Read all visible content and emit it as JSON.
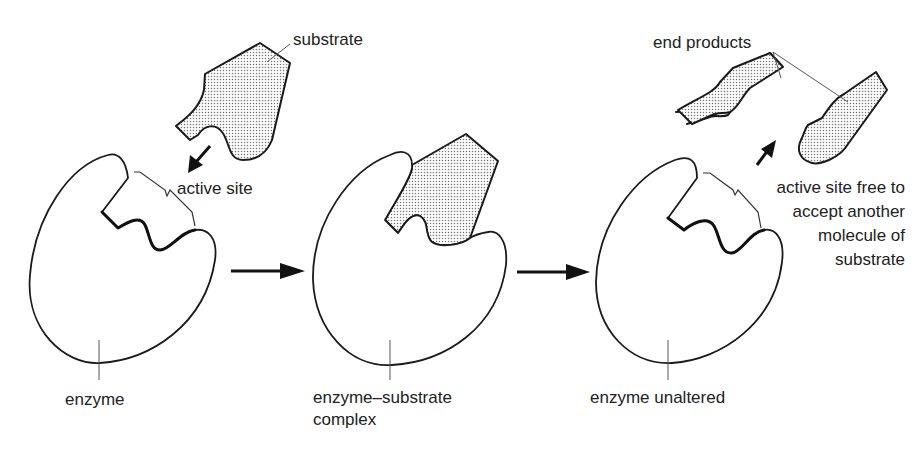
{
  "diagram": {
    "colors": {
      "ink": "#1a1a1a",
      "text": "#222222",
      "stipple": "#888888",
      "background": "#ffffff"
    },
    "stages": [
      {
        "id": "enzyme",
        "label": "enzyme",
        "annotations": {
          "substrate": "substrate",
          "active_site": "active site"
        }
      },
      {
        "id": "complex",
        "label_line1": "enzyme–substrate",
        "label_line2": "complex"
      },
      {
        "id": "unaltered",
        "label": "enzyme unaltered",
        "annotations": {
          "end_products": "end products",
          "active_site_free_line1": "active site free to",
          "active_site_free_line2": "accept another",
          "active_site_free_line3": "molecule of",
          "active_site_free_line4": "substrate"
        }
      }
    ],
    "transitions": [
      "enzyme-to-complex",
      "complex-to-unaltered"
    ]
  }
}
